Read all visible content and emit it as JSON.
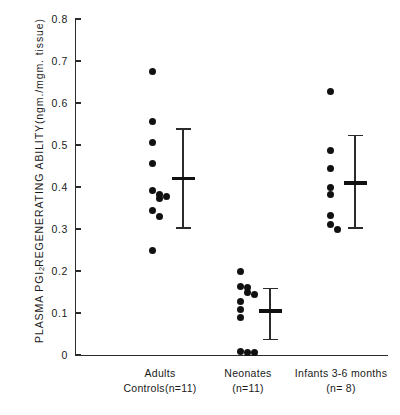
{
  "chart_data": {
    "type": "scatter",
    "title": "",
    "xlabel": "",
    "ylabel": "PLASMA PGI2 REGENERATING ABILITY(ngm./mgm. tissue)",
    "ylabel_parts": {
      "pre": "PLASMA  PGI",
      "sub": "2",
      "post": "  REGENERATING  ABILITY(ngm./mgm. tissue)"
    },
    "ylim": [
      0,
      0.8
    ],
    "ytick_labels": [
      "0.8",
      "0.7",
      "0.6",
      "0.5",
      "0.4",
      "0.3",
      "0.2",
      "0.1",
      "0"
    ],
    "ytick_values": [
      0.8,
      0.7,
      0.6,
      0.5,
      0.4,
      0.3,
      0.2,
      0.1,
      0
    ],
    "grid": false,
    "legend": "none",
    "categories": [
      "Adults Controls(n=11)",
      "Neonates (n=11)",
      "Infants 3-6 months (n= 8)"
    ],
    "groups": [
      {
        "name": "adults",
        "label_line1": "Adults",
        "label_line2": "Controls(n=11)",
        "n": 11,
        "points": [
          0.675,
          0.555,
          0.505,
          0.455,
          0.392,
          0.383,
          0.378,
          0.372,
          0.345,
          0.33,
          0.248
        ],
        "mean": 0.42,
        "error_top": 0.54,
        "error_bottom": 0.3
      },
      {
        "name": "neonates",
        "label_line1": "Neonates",
        "label_line2": "(n=11)",
        "n": 11,
        "points": [
          0.2,
          0.163,
          0.16,
          0.148,
          0.145,
          0.128,
          0.108,
          0.09,
          0.008,
          0.006,
          0.005
        ],
        "mean": 0.105,
        "error_top": 0.16,
        "error_bottom": 0.035
      },
      {
        "name": "infants",
        "label_line1": "Infants 3-6 months",
        "label_line2": "(n= 8)",
        "n": 8,
        "points": [
          0.628,
          0.487,
          0.445,
          0.4,
          0.383,
          0.332,
          0.31,
          0.3
        ],
        "mean": 0.41,
        "error_top": 0.525,
        "error_bottom": 0.3
      }
    ]
  },
  "colors": {
    "marker": "#111111",
    "axis": "#2b2b2b",
    "background": "#ffffff"
  }
}
